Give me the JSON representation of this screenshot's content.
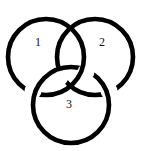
{
  "figure": {
    "kind": "link-diagram",
    "background_color": "#ffffff",
    "stroke_color": "#000000",
    "stroke_width": 4.6,
    "canvas": {
      "width": 142,
      "height": 151
    }
  },
  "rings": [
    {
      "id": "ring-1",
      "label": "1",
      "label_position": {
        "x": 35,
        "y": 36
      },
      "center": {
        "x": 46,
        "y": 57
      },
      "radius": 38
    },
    {
      "id": "ring-2",
      "label": "2",
      "label_position": {
        "x": 99,
        "y": 36
      },
      "center": {
        "x": 95,
        "y": 57
      },
      "radius": 38
    },
    {
      "id": "ring-3",
      "label": "3",
      "label_position": {
        "x": 66,
        "y": 98
      },
      "center": {
        "x": 71,
        "y": 105
      },
      "radius": 38
    }
  ]
}
